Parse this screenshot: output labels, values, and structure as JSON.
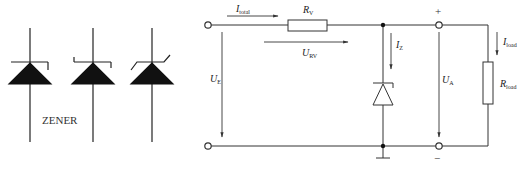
{
  "symbols": {
    "caption": "ZENER",
    "variants": [
      "zener-symbol-a",
      "zener-symbol-b",
      "zener-symbol-c"
    ]
  },
  "circuit": {
    "labels": {
      "i_total": {
        "main": "I",
        "sub": "total"
      },
      "r_v": {
        "main": "R",
        "sub": "V"
      },
      "u_rv": {
        "main": "U",
        "sub": "RV"
      },
      "i_z": {
        "main": "I",
        "sub": "Z"
      },
      "u_e": {
        "main": "U",
        "sub": "E"
      },
      "u_a": {
        "main": "U",
        "sub": "A"
      },
      "i_load": {
        "main": "I",
        "sub": "load"
      },
      "r_load": {
        "main": "R",
        "sub": "load"
      }
    },
    "polarity": {
      "plus": "+",
      "minus": "−"
    }
  },
  "colors": {
    "line": "#333333",
    "fill": "#111111",
    "background": "#ffffff"
  }
}
